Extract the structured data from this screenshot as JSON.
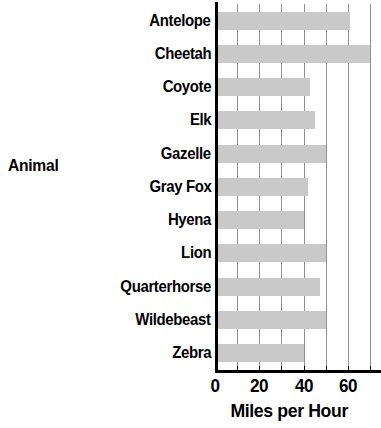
{
  "chart_data": {
    "type": "bar",
    "orientation": "horizontal",
    "title": "",
    "xlabel": "Miles per Hour",
    "ylabel": "Animal",
    "categories": [
      "Antelope",
      "Cheetah",
      "Coyote",
      "Elk",
      "Gazelle",
      "Gray Fox",
      "Hyena",
      "Lion",
      "Quarterhorse",
      "Wildebeast",
      "Zebra"
    ],
    "values": [
      61,
      70,
      43,
      45,
      50,
      42,
      40,
      50,
      47.5,
      50,
      40
    ],
    "xlim": [
      0,
      75
    ],
    "xticks": [
      0,
      20,
      40,
      60
    ],
    "xtick_labels": [
      "0",
      "20",
      "40",
      "60"
    ],
    "gridline_values": [
      10,
      20,
      30,
      40,
      50,
      60,
      70
    ],
    "grid": true,
    "legend": "none",
    "bar_color": "#c9c9c9",
    "axis_color": "#000000",
    "gridline_color": "#8f8f8f",
    "background_color": "#ffffff",
    "note": "Cheetah bar is clipped at the right edge of the plot area"
  }
}
